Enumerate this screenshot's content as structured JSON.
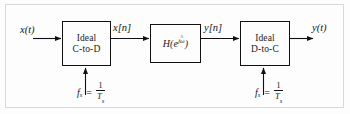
{
  "figure": {
    "kind": "block-diagram",
    "frame_color": "#d8d8d8",
    "line_color": "#111111",
    "background": "#fdfdfd"
  },
  "blocks": [
    {
      "id": "ctod",
      "name": "ideal-c-to-d-block",
      "line1": "Ideal",
      "line2": "C-to-D"
    },
    {
      "id": "filter",
      "name": "discrete-filter-block",
      "label_h": "H",
      "label_open": "(",
      "label_e": "e",
      "label_exp_j": "j",
      "label_exp_omega": "ω",
      "label_exp_hat": "^",
      "label_close": ")",
      "label_plain": "H(e^{jω̂})"
    },
    {
      "id": "dtoc",
      "name": "ideal-d-to-c-block",
      "line1": "Ideal",
      "line2": "D-to-C"
    }
  ],
  "signals": [
    {
      "id": "xt",
      "name": "input-signal-label",
      "text": "x(t)"
    },
    {
      "id": "xn",
      "name": "sampled-input-sequence-label",
      "text": "x[n]"
    },
    {
      "id": "yn",
      "name": "filtered-output-sequence-label",
      "text": "y[n]"
    },
    {
      "id": "yt",
      "name": "output-signal-label",
      "text": "y(t)"
    }
  ],
  "sampling": {
    "left": {
      "symbol": "f",
      "subscript": "s",
      "equals": "=",
      "numerator": "1",
      "denominator": "T",
      "denominator_subscript": "s",
      "plain": "f_s = 1/T_s"
    },
    "right": {
      "symbol": "f",
      "subscript": "s",
      "equals": "=",
      "numerator": "1",
      "denominator": "T",
      "denominator_subscript": "s",
      "plain": "f_s = 1/T_s"
    }
  }
}
